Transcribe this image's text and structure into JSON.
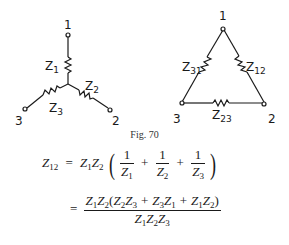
{
  "figure": {
    "caption": "Fig. 70",
    "star": {
      "nodes": [
        {
          "id": "1",
          "label": "1"
        },
        {
          "id": "2",
          "label": "2"
        },
        {
          "id": "3",
          "label": "3"
        }
      ],
      "impedances": [
        {
          "id": "Z1",
          "base": "Z",
          "sub": "1"
        },
        {
          "id": "Z2",
          "base": "Z",
          "sub": "2"
        },
        {
          "id": "Z3",
          "base": "Z",
          "sub": "3"
        }
      ]
    },
    "delta": {
      "nodes": [
        {
          "id": "1",
          "label": "1"
        },
        {
          "id": "2",
          "label": "2"
        },
        {
          "id": "3",
          "label": "3"
        }
      ],
      "impedances": [
        {
          "id": "Z12",
          "base": "Z",
          "sub": "12"
        },
        {
          "id": "Z23",
          "base": "Z",
          "sub": "23"
        },
        {
          "id": "Z31",
          "base": "Z",
          "sub": "31"
        }
      ]
    }
  },
  "equations": {
    "line1": {
      "lhs": {
        "base": "Z",
        "sub": "12"
      },
      "eq": "=",
      "prefix": [
        {
          "base": "Z",
          "sub": "1"
        },
        {
          "base": "Z",
          "sub": "2"
        }
      ],
      "fractions": [
        {
          "num": "1",
          "den_base": "Z",
          "den_sub": "1"
        },
        {
          "num": "1",
          "den_base": "Z",
          "den_sub": "2"
        },
        {
          "num": "1",
          "den_base": "Z",
          "den_sub": "3"
        }
      ],
      "plus": "+"
    },
    "line2": {
      "eq": "=",
      "numerator": "Z1Z2(Z2Z3 + Z3Z1 + Z1Z2)",
      "denominator": "Z1Z2Z3"
    }
  }
}
